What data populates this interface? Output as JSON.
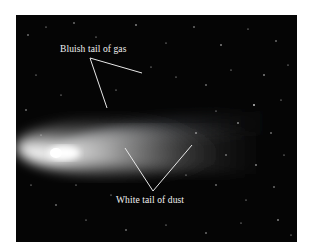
{
  "figure": {
    "labels": {
      "gas_tail": "Bluish tail of gas",
      "dust_tail": "White tail of dust"
    },
    "colors": {
      "background": "#050505",
      "label_text": "#f2f2f2",
      "leader_lines": "#e8e8e8",
      "page": "#ffffff"
    }
  }
}
